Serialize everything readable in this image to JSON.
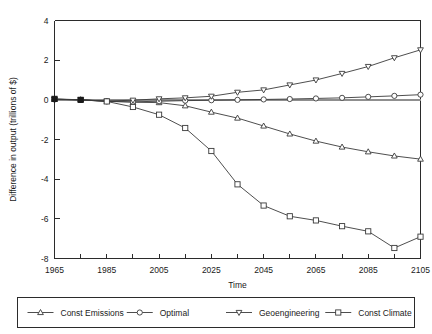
{
  "chart_data": {
    "type": "line",
    "title": "",
    "xlabel": "Time",
    "ylabel": "Difference in output (trillions of $)",
    "xlim": [
      1965,
      2105
    ],
    "ylim": [
      -8,
      4
    ],
    "xticks": [
      1965,
      1975,
      1985,
      1995,
      2005,
      2015,
      2025,
      2035,
      2045,
      2055,
      2065,
      2075,
      2085,
      2095,
      2105
    ],
    "xtick_labels": [
      "1965",
      "",
      "1985",
      "",
      "2005",
      "",
      "2025",
      "",
      "2045",
      "",
      "2065",
      "",
      "2085",
      "",
      "2105"
    ],
    "yticks": [
      4,
      2,
      0,
      -2,
      -4,
      -6,
      -8
    ],
    "ytick_labels": [
      "4",
      "2",
      "0",
      "-2",
      "-4",
      "-6",
      "-8"
    ],
    "grid": false,
    "legend_position": "below",
    "x": [
      1965,
      1975,
      1985,
      1995,
      2005,
      2015,
      2025,
      2035,
      2045,
      2055,
      2065,
      2075,
      2085,
      2095,
      2105
    ],
    "series": [
      {
        "name": "Const Emissions",
        "marker": "triangle-up",
        "values": [
          0.03,
          0.0,
          -0.07,
          -0.12,
          -0.14,
          -0.3,
          -0.62,
          -0.92,
          -1.32,
          -1.72,
          -2.08,
          -2.38,
          -2.62,
          -2.83,
          -2.99
        ]
      },
      {
        "name": "Optimal",
        "marker": "circle",
        "values": [
          0.02,
          0.0,
          -0.08,
          -0.1,
          -0.07,
          -0.04,
          -0.02,
          0.0,
          0.02,
          0.04,
          0.07,
          0.1,
          0.15,
          0.2,
          0.26
        ]
      },
      {
        "name": "Geoengineering",
        "marker": "triangle-down",
        "values": [
          0.03,
          0.0,
          -0.06,
          -0.02,
          0.05,
          0.1,
          0.18,
          0.38,
          0.5,
          0.75,
          1.0,
          1.33,
          1.68,
          2.12,
          2.52
        ]
      },
      {
        "name": "Const Climate",
        "marker": "square",
        "values": [
          0.05,
          0.0,
          -0.08,
          -0.36,
          -0.75,
          -1.42,
          -2.58,
          -4.26,
          -5.33,
          -5.87,
          -6.08,
          -6.37,
          -6.63,
          -7.47,
          -6.9
        ]
      }
    ]
  },
  "legend": {
    "entries": [
      {
        "label": "Const Emissions",
        "marker": "triangle-up-icon"
      },
      {
        "label": "Optimal",
        "marker": "circle-icon"
      },
      {
        "label": "Geoengineering",
        "marker": "triangle-down-icon"
      },
      {
        "label": "Const Climate",
        "marker": "square-icon"
      }
    ]
  },
  "colors": {
    "line": "#3a3a3a",
    "axis": "#2b2b2b",
    "zero_line": "#8f8f8f",
    "background": "#ffffff"
  }
}
